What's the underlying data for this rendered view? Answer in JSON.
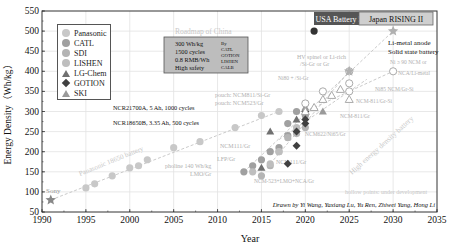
{
  "chart_data": {
    "type": "scatter",
    "title": "",
    "xlabel": "Year",
    "ylabel": "Energy Density（Wh/kg）",
    "xlim": [
      1990,
      2035
    ],
    "ylim": [
      50,
      550
    ],
    "xticks": [
      1990,
      1995,
      2000,
      2005,
      2010,
      2015,
      2020,
      2025,
      2030,
      2035
    ],
    "yticks": [
      50,
      100,
      150,
      200,
      250,
      300,
      350,
      400,
      450,
      500,
      550
    ],
    "grid": true,
    "legend_position": "upper left",
    "legend": [
      "Panasonic",
      "CATL",
      "SDI",
      "LISHEN",
      "LG-Chem",
      "GOTION",
      "SKI"
    ],
    "series": [
      {
        "name": "Panasonic",
        "marker": "circle",
        "color": "#c8c8c8",
        "points": [
          [
            1995,
            110
          ],
          [
            1996,
            120
          ],
          [
            1998,
            140
          ],
          [
            2000,
            160
          ],
          [
            2001,
            165
          ],
          [
            2002,
            180
          ],
          [
            2005,
            210
          ],
          [
            2008,
            225
          ],
          [
            2012,
            260
          ],
          [
            2015,
            290
          ],
          [
            2017,
            300
          ]
        ]
      },
      {
        "name": "CATL",
        "marker": "circle",
        "color": "#a0a0a0",
        "points": [
          [
            2013,
            150
          ],
          [
            2014,
            165
          ],
          [
            2015,
            180
          ],
          [
            2016,
            200
          ],
          [
            2017,
            210
          ],
          [
            2018,
            240
          ],
          [
            2018,
            270
          ],
          [
            2019,
            300
          ],
          [
            2020,
            290
          ]
        ]
      },
      {
        "name": "SDI",
        "marker": "circle",
        "color": "#b4b4b4",
        "points": [
          [
            2015,
            140
          ],
          [
            2016,
            165
          ],
          [
            2017,
            200
          ],
          [
            2018,
            235
          ],
          [
            2019,
            245
          ],
          [
            2020,
            260
          ]
        ]
      },
      {
        "name": "LISHEN",
        "marker": "circle",
        "color": "#bebebe",
        "points": [
          [
            2014,
            150
          ],
          [
            2016,
            170
          ],
          [
            2017,
            200
          ],
          [
            2019,
            260
          ]
        ]
      },
      {
        "name": "LG-Chem",
        "marker": "triangle",
        "color": "#707070",
        "points": [
          [
            2015,
            160
          ],
          [
            2016,
            250
          ],
          [
            2019,
            280
          ]
        ]
      },
      {
        "name": "GOTION",
        "marker": "diamond",
        "color": "#404040",
        "points": [
          [
            2018,
            170
          ],
          [
            2019,
            215
          ],
          [
            2019,
            250
          ],
          [
            2020,
            270
          ],
          [
            2020,
            280
          ],
          [
            2020,
            300
          ]
        ]
      },
      {
        "name": "SKI",
        "marker": "triangle",
        "color": "#9a9a9a",
        "points": [
          [
            2020,
            310
          ],
          [
            2022,
            300
          ]
        ]
      },
      {
        "name": "Sony",
        "marker": "star",
        "color": "#888888",
        "points": [
          [
            1991,
            80
          ]
        ]
      },
      {
        "name": "Development targets (open)",
        "marker": "open-circle",
        "color": "#aaaaaa",
        "points": [
          [
            2020,
            320
          ],
          [
            2022,
            350
          ],
          [
            2025,
            350
          ],
          [
            2025,
            370
          ],
          [
            2025,
            400
          ],
          [
            2030,
            400
          ]
        ]
      },
      {
        "name": "Development targets (open triangle)",
        "marker": "open-triangle",
        "color": "#aaaaaa",
        "points": [
          [
            2020,
            300
          ],
          [
            2021,
            310
          ],
          [
            2022,
            330
          ],
          [
            2023,
            340
          ],
          [
            2024,
            355
          ],
          [
            2025,
            330
          ]
        ]
      },
      {
        "name": "Targets (stars)",
        "marker": "star",
        "color": "#b0b0b0",
        "points": [
          [
            2025,
            400
          ],
          [
            2030,
            500
          ]
        ]
      },
      {
        "name": "USA Battery 500",
        "marker": "circle",
        "color": "#333333",
        "points": [
          [
            2021,
            500
          ]
        ]
      }
    ],
    "annotations": [
      "Roadmap of China",
      "300 Wh/kg",
      "1500 cycles",
      "0.8 RMB/Wh",
      "High safety",
      "By",
      "CATL",
      "GOTION",
      "LISHEN",
      "CALB",
      "USA Battery 500",
      "Japan RISING II",
      "Li-metal anode",
      "Solid state battery",
      "HV spinel or Li-rich",
      "/Si-Gr or Gr",
      "Ni ≥ 90 NCM or",
      "NCA/Li-metal",
      "Ni80 + /Si-Gr",
      "Ni85 NCM/Gr-Si",
      "pouch: NCM811/Si-Gr",
      "pouch: NCM523/Gr",
      "NCM-811/Gr-Si",
      "NCM-811/Gr",
      "NCM622/Ni65/Gr",
      "NCR21700A, 5 Ah, 1000 cycles",
      "NCR18650B, 3.35 Ah, 500 cycles",
      "Panasonic 18650 battery",
      "NCM111/Gr",
      "LFP/Gr",
      "pholine 140 Wh/kg",
      "LMO/Gr",
      "NCM111/Gr",
      "NCM-523+LMO+NCA/Gr",
      "High energy density battery",
      "hollow points: under development",
      "Sony",
      "Drawn by Yi Wang, Yaxiang Lu, Yu Ren, Zhiwei Yang, Hong Li"
    ]
  },
  "legend": {
    "items": [
      {
        "label": "Panasonic",
        "marker": "circle",
        "color": "#c8c8c8"
      },
      {
        "label": "CATL",
        "marker": "circle",
        "color": "#a0a0a0"
      },
      {
        "label": "SDI",
        "marker": "circle",
        "color": "#b4b4b4"
      },
      {
        "label": "LISHEN",
        "marker": "circle",
        "color": "#bebebe"
      },
      {
        "label": "LG-Chem",
        "marker": "triangle",
        "color": "#707070"
      },
      {
        "label": "GOTION",
        "marker": "diamond",
        "color": "#404040"
      },
      {
        "label": "SKI",
        "marker": "triangle",
        "color": "#9a9a9a"
      }
    ]
  },
  "labels": {
    "xlabel": "Year",
    "ylabel": "Energy Density（Wh/kg）",
    "roadmap_title": "Roadmap of China",
    "roadmap_lines": [
      "300 Wh/kg",
      "1500 cycles",
      "0.8 RMB/Wh",
      "High safety"
    ],
    "roadmap_by": [
      "By",
      "CATL",
      "GOTION",
      "LISHEN",
      "CALB"
    ],
    "usa": "USA Battery 500",
    "japan": "Japan RISING II",
    "limetal": "Li-metal anode",
    "solid": "Solid state battery",
    "hv1": "HV spinel or Li-rich",
    "hv2": "/Si-Gr or Gr",
    "ni90a": "Ni ≥ 90 NCM or",
    "ni90b": "NCA/Li-metal",
    "ni80": "Ni80 + /Si-Gr",
    "ni85": "Ni85 NCM/Gr-Si",
    "pouch1": "pouch: NCM811/Si-Gr",
    "pouch2": "pouch: NCM523/Gr",
    "ncm811si": "NCM-811/Gr-Si",
    "ncm811": "NCM-811/Gr",
    "ncm622": "NCM622/Ni65/Gr",
    "ncr21700": "NCR21700A, 5 Ah, 1000 cycles",
    "ncr18650": "NCR18650B, 3.35 Ah, 500 cycles",
    "pana18650": "Panasonic 18650 battery",
    "ncm111a": "NCM111/Gr",
    "lfp": "LFP/Gr",
    "pholine": "pholine 140 Wh/kg",
    "lmo": "LMO/Gr",
    "ncm111b": "NCM111/Gr",
    "ncm523": "NCM-523+LMO+NCA/Gr",
    "highenergy": "High energy density battery",
    "hollow": "hollow points: under development",
    "sony": "Sony",
    "credit": "Drawn by Yi Wang, Yaxiang Lu, Yu Ren, Zhiwei Yang, Hong Li"
  }
}
